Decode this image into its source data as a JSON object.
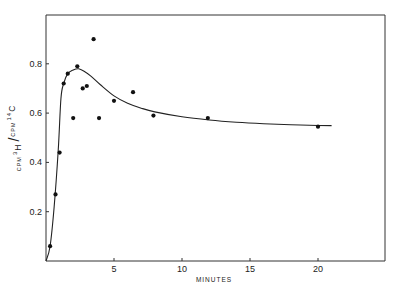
{
  "chart_data": {
    "type": "scatter",
    "title": "",
    "xlabel": "MINUTES",
    "ylabel": "CPM 3H / CPM 14C",
    "ylabel_parts": {
      "num_prefix": "CPM",
      "num_sup": "3",
      "num_el": "H",
      "den_prefix": "CPM",
      "den_sup": "14",
      "den_el": "C"
    },
    "xlim": [
      0,
      25
    ],
    "ylim": [
      0,
      1.0
    ],
    "xticks": [
      5,
      10,
      15,
      20
    ],
    "xtick_labels": [
      "5",
      "10",
      "15",
      "20"
    ],
    "yticks": [
      0.2,
      0.4,
      0.6,
      0.8
    ],
    "ytick_labels": [
      "0.2",
      "0.4",
      "0.6",
      "0.8"
    ],
    "grid": false,
    "legend": null,
    "series": [
      {
        "name": "observed",
        "style": "points",
        "x": [
          0.3,
          0.7,
          1.0,
          1.3,
          1.6,
          2.0,
          2.3,
          2.7,
          3.0,
          3.5,
          3.9,
          5.0,
          6.4,
          7.9,
          11.9,
          20.0
        ],
        "y": [
          0.06,
          0.27,
          0.44,
          0.72,
          0.76,
          0.58,
          0.79,
          0.7,
          0.71,
          0.9,
          0.58,
          0.65,
          0.685,
          0.59,
          0.58,
          0.545
        ]
      },
      {
        "name": "fitted curve",
        "style": "line",
        "x": [
          0.0,
          0.3,
          0.6,
          0.9,
          1.1,
          1.3,
          1.6,
          2.0,
          2.4,
          2.8,
          3.3,
          4.0,
          5.0,
          6.0,
          7.0,
          8.0,
          10.0,
          12.0,
          14.0,
          16.0,
          18.0,
          20.0,
          21.0
        ],
        "y": [
          0.0,
          0.06,
          0.22,
          0.45,
          0.66,
          0.72,
          0.76,
          0.775,
          0.78,
          0.77,
          0.75,
          0.715,
          0.67,
          0.64,
          0.62,
          0.605,
          0.585,
          0.572,
          0.563,
          0.557,
          0.553,
          0.55,
          0.549
        ]
      }
    ]
  }
}
